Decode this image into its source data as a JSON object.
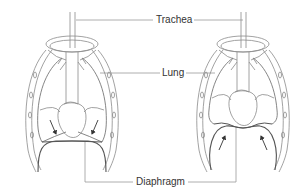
{
  "figure": {
    "panels": [
      {
        "id": "left",
        "state": "diaphragm contracted / flattened",
        "arrow_direction": "down"
      },
      {
        "id": "right",
        "state": "diaphragm relaxed / domed",
        "arrow_direction": "up"
      }
    ],
    "labels": {
      "trachea": "Trachea",
      "lung": "Lung",
      "diaphragm": "Diaphragm"
    },
    "colors": {
      "outline": "#8a8a8a",
      "dark_outline": "#555555",
      "arrow": "#333333",
      "leader_line": "#9a9a9a",
      "text": "#333333",
      "background": "#ffffff"
    }
  }
}
